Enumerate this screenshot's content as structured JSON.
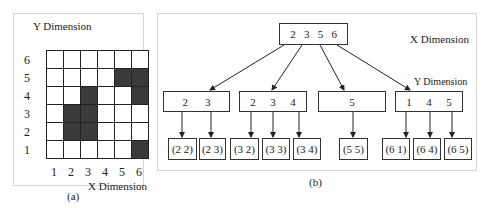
{
  "panel_a": {
    "caption": "(a)",
    "y_label": "Y Dimension",
    "x_label": "X Dimension",
    "y_ticks": [
      "6",
      "5",
      "4",
      "3",
      "2",
      "1"
    ],
    "x_ticks": [
      "1",
      "2",
      "3",
      "4",
      "5",
      "6"
    ],
    "filled_cells": [
      [
        2,
        2
      ],
      [
        2,
        3
      ],
      [
        3,
        2
      ],
      [
        3,
        3
      ],
      [
        3,
        4
      ],
      [
        5,
        5
      ],
      [
        6,
        1
      ],
      [
        6,
        4
      ],
      [
        6,
        5
      ]
    ]
  },
  "panel_b": {
    "caption": "(b)",
    "x_dim_label": "X Dimension",
    "y_dim_label": "Y Dimension",
    "root": {
      "keys": [
        "2",
        "3",
        "5",
        "6"
      ]
    },
    "level2": [
      {
        "keys": [
          "2",
          "3"
        ]
      },
      {
        "keys": [
          "2",
          "3",
          "4"
        ]
      },
      {
        "keys": [
          "5"
        ]
      },
      {
        "keys": [
          "1",
          "4",
          "5"
        ]
      }
    ],
    "leaves": [
      "(2 2)",
      "(2 3)",
      "(3 2)",
      "(3 3)",
      "(3 4)",
      "(5 5)",
      "(6 1)",
      "(6 4)",
      "(6 5)"
    ]
  }
}
